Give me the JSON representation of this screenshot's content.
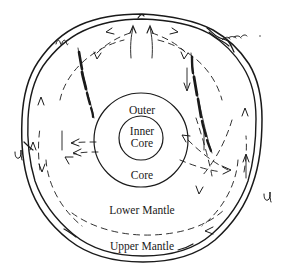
{
  "figure": {
    "background_color": "#ffffff",
    "ink_color": "#1a1a1a",
    "style": "hand-drawn line sketch"
  },
  "labels": {
    "outer": "Outer",
    "inner": "Inner",
    "inner_core_line2": "Core",
    "core": "Core",
    "lower_mantle": "Lower Mantle",
    "upper_mantle": "Upper Mantle"
  },
  "layers": [
    {
      "name": "inner-core",
      "label": "Inner Core",
      "cx": 141,
      "cy": 138,
      "r": 22
    },
    {
      "name": "outer-core",
      "label": "Outer Core",
      "cx": 141,
      "cy": 140,
      "r": 47
    },
    {
      "name": "lower-mantle",
      "label": "Lower Mantle"
    },
    {
      "name": "upper-mantle",
      "label": "Upper Mantle"
    },
    {
      "name": "lithosphere",
      "label": "Lithosphere"
    }
  ],
  "annotations": {
    "squiggle_top_left": "subduction-squiggle",
    "squiggle_top_right": "subduction-squiggle",
    "squiggle_left": "plate-boundary-squiggle",
    "squiggle_right": "plate-boundary-squiggle"
  },
  "features": {
    "upwelling_arrows": 2,
    "subducting_slabs": 2,
    "convection_arrows": 14
  }
}
